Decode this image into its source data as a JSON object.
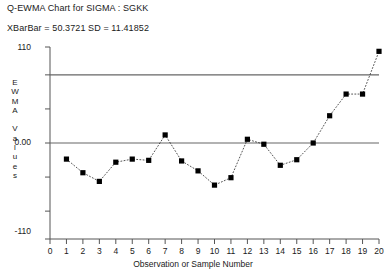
{
  "chart_data": {
    "type": "scatter",
    "title": "Q-EWMA Chart for SIGMA : SGKK",
    "subtitle": "XBarBar = 50.3721 SD = 11.41852",
    "xlabel": "Observation or Sample Number",
    "ylabel": "EWMA Values",
    "ylabel_chars": [
      "E",
      "W",
      "M",
      "A",
      "",
      "V",
      "a",
      "l",
      "u",
      "e",
      "s"
    ],
    "xlim": [
      0,
      20
    ],
    "ylim": [
      -155,
      155
    ],
    "xticks": [
      0,
      1,
      2,
      3,
      4,
      5,
      6,
      7,
      8,
      9,
      10,
      11,
      12,
      13,
      14,
      15,
      16,
      17,
      18,
      19,
      20
    ],
    "xtick_labels": [
      "0",
      "1",
      "2",
      "3",
      "4",
      "5",
      "6",
      "7",
      "8",
      "9",
      "10",
      "11",
      "12",
      "13",
      "14",
      "15",
      "16",
      "17",
      "18",
      "19",
      "20"
    ],
    "yticks": [
      110,
      0,
      -110
    ],
    "ytick_labels": [
      "110",
      "0.00",
      "-110"
    ],
    "grid": false,
    "legend": false,
    "center_line": 0.0,
    "upper_control_limit": 110,
    "x": [
      1,
      2,
      3,
      4,
      5,
      6,
      7,
      8,
      9,
      10,
      11,
      12,
      13,
      14,
      15,
      16,
      17,
      18,
      19,
      20
    ],
    "values": [
      -26,
      -48,
      -62,
      -31,
      -26,
      -28,
      13,
      -29,
      -45,
      -68,
      -56,
      6,
      -2,
      -36,
      -27,
      0,
      44,
      79,
      79,
      148
    ],
    "marker": "filled-square",
    "line_style": "dotted",
    "series_color": "#000000",
    "reference_line_color": "#666666",
    "axis_color": "#555555"
  },
  "meta": {
    "background_color": "#ffffff"
  }
}
